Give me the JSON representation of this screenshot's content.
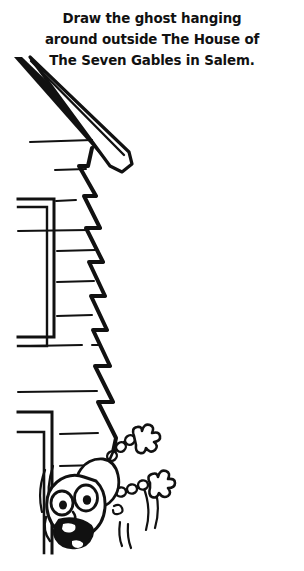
{
  "page": {
    "width": 304,
    "height": 571,
    "background_color": "#ffffff",
    "ink_color": "#111111"
  },
  "prompt": {
    "full_text": "Draw the ghost hanging around outside The House of The Seven Gables in Salem.",
    "line1": "Draw the ghost hanging",
    "line2": "around outside The House of",
    "line3": "The Seven Gables in Salem."
  },
  "illustration": {
    "title": "house-corner-with-hanging-cartoon-figure",
    "style": "black-and-white-cartoon-line-drawing",
    "elements": [
      {
        "name": "roof-eave-band",
        "description": "thick solid black diagonal roof edge running from upper-left down to the right",
        "fill": "#111111"
      },
      {
        "name": "roof-fascia-strip",
        "description": "white parallel strip outlined in black below the solid roof band",
        "fill": "#ffffff"
      },
      {
        "name": "gable-zigzag-edge",
        "description": "stair-stepped clapboard corner edge descending vertically through the middle of the drawing"
      },
      {
        "name": "siding-lines",
        "description": "horizontal clapboard siding lines on the left wall"
      },
      {
        "name": "window-frame-upper",
        "description": "bracket shaped window casing on the left wall"
      },
      {
        "name": "window-frame-lower",
        "description": "second bracket shaped window casing below the first"
      },
      {
        "name": "cartoon-figure",
        "description": "wide-eyed screaming cartoon character hanging upside down from the house corner, waving both gloved hands",
        "features": [
          "two-large-eyes",
          "open-screaming-mouth",
          "two-gloved-hands",
          "motion-lines"
        ]
      }
    ]
  }
}
